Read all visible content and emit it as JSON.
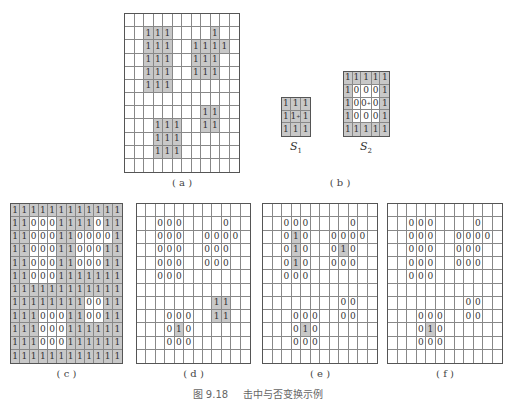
{
  "figure": {
    "caption_number": "图 9.18",
    "caption_text": "击中与否变换示例"
  },
  "legend": {
    "s1_label": "S",
    "s1_sub": "1",
    "s2_label": "S",
    "s2_sub": "2"
  },
  "panels": [
    {
      "id": "a",
      "label": "( a )",
      "box": {
        "x": 124,
        "y": 13,
        "w": 116,
        "h": 160
      },
      "rows": [
        "............",
        "..111....1..",
        "..111..1111.",
        "..111..111..",
        "..111..111..",
        "..111.......",
        "............",
        "........11..",
        "...111..11..",
        "...111......",
        "...111......",
        "............"
      ],
      "shade": "1",
      "label_pos": {
        "x": 124,
        "y": 177,
        "w": 116
      }
    },
    {
      "id": "S1",
      "label": "",
      "box": {
        "x": 281,
        "y": 97,
        "w": 30,
        "h": 40
      },
      "rows": [
        "111",
        "1c1",
        "111"
      ],
      "shade": "all"
    },
    {
      "id": "S2",
      "label": "",
      "box": {
        "x": 343,
        "y": 71,
        "w": 47,
        "h": 66
      },
      "rows": [
        "11111",
        "10001",
        "10z01",
        "10001",
        "11111"
      ],
      "shade": "1"
    },
    {
      "id": "c",
      "label": "( c )",
      "box": {
        "x": 10,
        "y": 203,
        "w": 113,
        "h": 161
      },
      "rows": [
        "111111111111",
        "110001111011",
        "110001100001",
        "110001100011",
        "110001100011",
        "110001111111",
        "111111111111",
        "111111110011",
        "111000110011",
        "111000111111",
        "111000111111",
        "111111111111"
      ],
      "shade": "1",
      "label_pos": {
        "x": 10,
        "y": 368,
        "w": 113
      }
    },
    {
      "id": "d",
      "label": "( d )",
      "box": {
        "x": 136,
        "y": 203,
        "w": 115,
        "h": 161
      },
      "rows": [
        "............",
        "..000....0..",
        "..000..0000.",
        "..000..000..",
        "..000..000..",
        "..000.......",
        "............",
        "........11..",
        "...000..11..",
        "...010......",
        "...000......",
        "............"
      ],
      "shade": "1",
      "label_pos": {
        "x": 136,
        "y": 368,
        "w": 115
      }
    },
    {
      "id": "e",
      "label": "( e )",
      "box": {
        "x": 262,
        "y": 203,
        "w": 116,
        "h": 161
      },
      "rows": [
        "............",
        "..000....0..",
        "..010..0000.",
        "..010..010..",
        "..010..000..",
        "..000.......",
        "............",
        "........00..",
        "...000..00..",
        "...010......",
        "...000......",
        "............"
      ],
      "shade": "1",
      "label_pos": {
        "x": 262,
        "y": 368,
        "w": 116
      }
    },
    {
      "id": "f",
      "label": "( f )",
      "box": {
        "x": 387,
        "y": 203,
        "w": 116,
        "h": 161
      },
      "rows": [
        "............",
        "..000....0..",
        "..000..0000.",
        "..000..000..",
        "..000..000..",
        "..000.......",
        "............",
        "........00..",
        "...000..00..",
        "...010......",
        "...000......",
        "............"
      ],
      "shade": "1",
      "label_pos": {
        "x": 387,
        "y": 368,
        "w": 116
      }
    }
  ],
  "panel_b": {
    "label": "( b )",
    "label_pos": {
      "x": 290,
      "y": 177,
      "w": 100
    }
  }
}
